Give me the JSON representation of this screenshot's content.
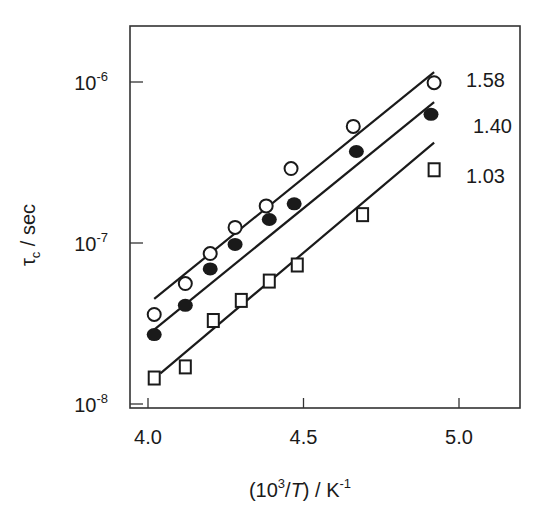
{
  "chart_data": {
    "type": "scatter",
    "title": "",
    "xlabel": "(10^3/T) / K^-1",
    "ylabel": "τc / sec",
    "xlim": [
      3.95,
      5.19
    ],
    "ylim_log10": [
      -8.02,
      -5.65
    ],
    "yscale": "log",
    "x_ticks": [
      "4.0",
      "4.5",
      "5.0"
    ],
    "x_tick_values": [
      4.0,
      4.5,
      5.0
    ],
    "y_ticks": [
      "10^-8",
      "10^-7",
      "10^-6"
    ],
    "y_tick_values": [
      1e-08,
      1e-07,
      1e-06
    ],
    "grid": false,
    "legend": "none (series labelled at line ends)",
    "series": [
      {
        "name": "1.58",
        "marker": "open-circle",
        "x": [
          4.02,
          4.12,
          4.2,
          4.28,
          4.38,
          4.46,
          4.66,
          4.92
        ],
        "y": [
          3.6e-08,
          5.6e-08,
          8.6e-08,
          1.25e-07,
          1.7e-07,
          2.9e-07,
          5.3e-07,
          9.9e-07
        ],
        "fit_line": {
          "x": [
            4.02,
            4.92
          ],
          "y": [
            4.5e-08,
            1.15e-06
          ]
        }
      },
      {
        "name": "1.40",
        "marker": "filled-circle",
        "x": [
          4.02,
          4.12,
          4.2,
          4.28,
          4.39,
          4.47,
          4.67,
          4.91
        ],
        "y": [
          2.7e-08,
          4.1e-08,
          6.9e-08,
          9.8e-08,
          1.4e-07,
          1.75e-07,
          3.7e-07,
          6.3e-07
        ],
        "fit_line": {
          "x": [
            4.02,
            4.92
          ],
          "y": [
            2.9e-08,
            7.5e-07
          ]
        }
      },
      {
        "name": "1.03",
        "marker": "open-square",
        "x": [
          4.02,
          4.12,
          4.21,
          4.3,
          4.39,
          4.48,
          4.69,
          4.92
        ],
        "y": [
          1.45e-08,
          1.7e-08,
          3.3e-08,
          4.4e-08,
          5.8e-08,
          7.3e-08,
          1.5e-07,
          2.85e-07
        ],
        "fit_line": {
          "x": [
            4.04,
            4.92
          ],
          "y": [
            1.55e-08,
            4.2e-07
          ]
        }
      }
    ],
    "annotations": [
      "1.58",
      "1.40",
      "1.03"
    ]
  },
  "labels": {
    "x_axis_prefix": "(10",
    "x_axis_sup": "3",
    "x_axis_mid": "/",
    "x_axis_T": "T",
    "x_axis_suffix": ") / K",
    "x_axis_sup2": "-1",
    "y_axis_tau": "τ",
    "y_axis_sub": "c",
    "y_axis_unit": " / sec"
  }
}
